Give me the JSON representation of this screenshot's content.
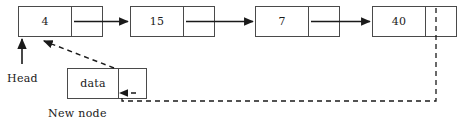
{
  "diagram": {
    "background_color": "#ffffff",
    "stroke_color": "#4a4a4a",
    "arrow_color": "#1a1a1a",
    "dashed_color": "#3a3a3a"
  },
  "list_nodes": [
    {
      "value": "4",
      "next_label": ""
    },
    {
      "value": "15",
      "next_label": ""
    },
    {
      "value": "7",
      "next_label": ""
    },
    {
      "value": "40",
      "next_label": ""
    }
  ],
  "new_node": {
    "value": "data",
    "next_label": "",
    "caption": "New node"
  },
  "head": {
    "label": "Head"
  }
}
